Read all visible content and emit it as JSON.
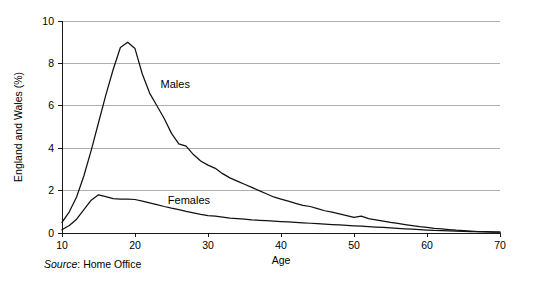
{
  "chart_data": {
    "type": "line",
    "title": "",
    "xlabel": "Age",
    "ylabel": "England and Wales (%)",
    "xlim": [
      10,
      70
    ],
    "ylim": [
      0,
      10
    ],
    "xticks": [
      10,
      20,
      30,
      40,
      50,
      60,
      70
    ],
    "yticks": [
      0,
      2,
      4,
      6,
      8,
      10
    ],
    "grid": "horizontal",
    "legend_position": "inline-annotation",
    "series": [
      {
        "name": "Males",
        "label": "Males",
        "x": [
          10,
          11,
          12,
          13,
          14,
          15,
          16,
          17,
          18,
          19,
          20,
          21,
          22,
          23,
          24,
          25,
          26,
          27,
          28,
          29,
          30,
          31,
          32,
          33,
          34,
          35,
          36,
          37,
          38,
          39,
          40,
          41,
          42,
          43,
          44,
          45,
          46,
          47,
          48,
          49,
          50,
          51,
          52,
          53,
          54,
          55,
          56,
          57,
          58,
          59,
          60,
          61,
          62,
          63,
          64,
          65,
          66,
          67,
          68,
          69,
          70
        ],
        "values": [
          0.5,
          1.0,
          1.7,
          2.7,
          3.9,
          5.2,
          6.5,
          7.7,
          8.75,
          9.0,
          8.7,
          7.5,
          6.6,
          6.0,
          5.4,
          4.7,
          4.2,
          4.1,
          3.7,
          3.4,
          3.2,
          3.05,
          2.8,
          2.6,
          2.45,
          2.3,
          2.15,
          2.0,
          1.85,
          1.7,
          1.6,
          1.5,
          1.4,
          1.3,
          1.25,
          1.15,
          1.05,
          0.98,
          0.9,
          0.82,
          0.74,
          0.8,
          0.68,
          0.62,
          0.56,
          0.5,
          0.45,
          0.4,
          0.35,
          0.3,
          0.26,
          0.22,
          0.19,
          0.16,
          0.13,
          0.11,
          0.09,
          0.07,
          0.06,
          0.05,
          0.04
        ]
      },
      {
        "name": "Females",
        "label": "Females",
        "x": [
          10,
          11,
          12,
          13,
          14,
          15,
          16,
          17,
          18,
          19,
          20,
          21,
          22,
          23,
          24,
          25,
          26,
          27,
          28,
          29,
          30,
          31,
          32,
          33,
          34,
          35,
          36,
          37,
          38,
          39,
          40,
          41,
          42,
          43,
          44,
          45,
          46,
          47,
          48,
          49,
          50,
          51,
          52,
          53,
          54,
          55,
          56,
          57,
          58,
          59,
          60,
          61,
          62,
          63,
          64,
          65,
          66,
          67,
          68,
          69,
          70
        ],
        "values": [
          0.15,
          0.35,
          0.65,
          1.1,
          1.55,
          1.8,
          1.72,
          1.62,
          1.6,
          1.6,
          1.58,
          1.5,
          1.42,
          1.34,
          1.25,
          1.17,
          1.1,
          1.02,
          0.95,
          0.88,
          0.82,
          0.8,
          0.75,
          0.7,
          0.68,
          0.65,
          0.62,
          0.6,
          0.58,
          0.56,
          0.54,
          0.52,
          0.5,
          0.48,
          0.46,
          0.44,
          0.42,
          0.4,
          0.38,
          0.36,
          0.34,
          0.32,
          0.3,
          0.28,
          0.26,
          0.24,
          0.22,
          0.2,
          0.18,
          0.16,
          0.14,
          0.12,
          0.11,
          0.1,
          0.09,
          0.08,
          0.07,
          0.06,
          0.05,
          0.045,
          0.04
        ]
      }
    ],
    "annotations": [
      {
        "text": "Males",
        "x": 23.5,
        "y": 6.85
      },
      {
        "text": "Females",
        "x": 24.5,
        "y": 1.35
      }
    ]
  },
  "source": {
    "prefix": "Source",
    "separator": ": ",
    "value": "Home Office"
  }
}
